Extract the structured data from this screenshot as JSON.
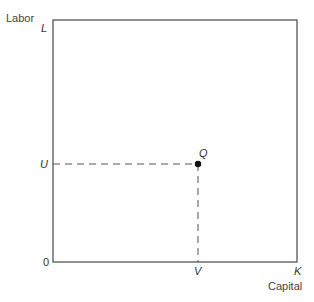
{
  "diagram": {
    "y_axis_title": "Labor",
    "x_axis_title": "Capital",
    "labels": {
      "top_left": "L",
      "origin": "0",
      "bottom_right": "K",
      "u": "U",
      "v": "V",
      "q": "Q"
    },
    "colors": {
      "line": "#555555",
      "point": "#111111"
    }
  }
}
